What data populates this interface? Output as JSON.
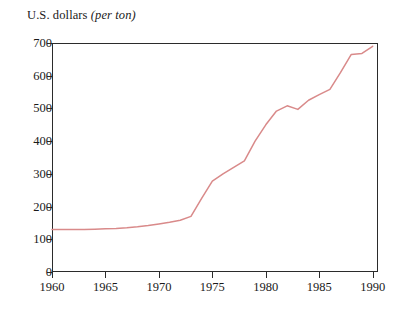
{
  "figure": {
    "title_main": "U.S. dollars",
    "title_italic": "(per ton)",
    "background_color": "#ffffff",
    "frame_color": "#2b2b2b",
    "line_color": "#d98a8a"
  },
  "chart_data": {
    "type": "line",
    "title": "U.S. dollars (per ton)",
    "xlabel": "",
    "ylabel": "U.S. dollars (per ton)",
    "xlim": [
      1960,
      1990.5
    ],
    "ylim": [
      0,
      700
    ],
    "grid": false,
    "legend": "none",
    "xticks": [
      1960,
      1965,
      1970,
      1975,
      1980,
      1985,
      1990
    ],
    "xtick_labels": [
      "1960",
      "1965",
      "1970",
      "1975",
      "1980",
      "1985",
      "1990"
    ],
    "yticks": [
      0,
      100,
      200,
      300,
      400,
      500,
      600,
      700
    ],
    "ytick_labels": [
      "0",
      "100",
      "200",
      "300",
      "400",
      "500",
      "600",
      "700"
    ],
    "series": [
      {
        "name": "U.S. dollars per ton",
        "color": "#d98a8a",
        "x": [
          1960,
          1961,
          1962,
          1963,
          1964,
          1965,
          1966,
          1967,
          1968,
          1969,
          1970,
          1971,
          1972,
          1973,
          1974,
          1975,
          1976,
          1977,
          1978,
          1979,
          1980,
          1981,
          1982,
          1983,
          1984,
          1985,
          1986,
          1987,
          1988,
          1989,
          1990
        ],
        "values": [
          130,
          130,
          130,
          130,
          131,
          132,
          133,
          135,
          138,
          142,
          147,
          152,
          158,
          170,
          225,
          278,
          300,
          320,
          340,
          400,
          450,
          492,
          508,
          497,
          525,
          542,
          558,
          610,
          665,
          668,
          690
        ]
      }
    ]
  }
}
